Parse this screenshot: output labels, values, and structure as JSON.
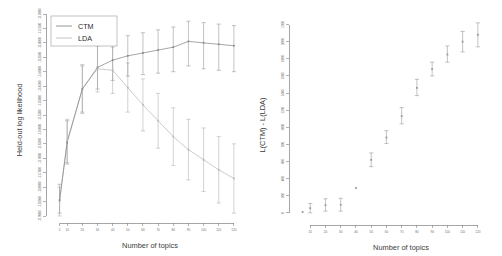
{
  "figure": {
    "background_color": "#ffffff"
  },
  "chart_data": [
    {
      "id": "held-out-likelihood",
      "type": "line",
      "title": "",
      "xlabel": "Number of topics",
      "ylabel": "Held-out log likelihood",
      "grid": false,
      "legend_position": "top-left",
      "xlim": [
        0,
        126
      ],
      "ylim": [
        -119000,
        -112000
      ],
      "xticks": [
        5,
        10,
        20,
        30,
        40,
        50,
        60,
        70,
        80,
        90,
        100,
        110,
        120
      ],
      "xtick_labels": [
        "5",
        "10",
        "20",
        "30",
        "40",
        "50",
        "60",
        "70",
        "80",
        "90",
        "100",
        "110",
        "120"
      ],
      "yticks": [
        -119000,
        -118500,
        -118000,
        -117500,
        -117000,
        -116500,
        -116000,
        -115500,
        -115000,
        -114500,
        -114000,
        -113500,
        -113000,
        -112500,
        -112000
      ],
      "ytick_labels": [
        "-119000",
        "-118500",
        "-118000",
        "-117500",
        "-117000",
        "-116500",
        "-116000",
        "-115500",
        "-115000",
        "-114500",
        "-114000",
        "-113500",
        "-113000",
        "-112500",
        "-112000"
      ],
      "x": [
        5,
        10,
        20,
        30,
        40,
        50,
        60,
        70,
        80,
        90,
        100,
        110,
        120
      ],
      "series": [
        {
          "name": "CTM",
          "color": "#8a8a8a",
          "values": [
            -118450,
            -116450,
            -114600,
            -113850,
            -113600,
            -113450,
            -113350,
            -113250,
            -113150,
            -112950,
            -113000,
            -113050,
            -113100
          ],
          "err_low": [
            -118900,
            -117200,
            -115400,
            -114600,
            -114300,
            -114150,
            -114100,
            -114050,
            -114000,
            -113800,
            -113900,
            -113950,
            -114000
          ],
          "err_high": [
            -117900,
            -115700,
            -113800,
            -113100,
            -112900,
            -112750,
            -112650,
            -112550,
            -112450,
            -112250,
            -112300,
            -112350,
            -112400
          ]
        },
        {
          "name": "LDA",
          "color": "#b9b9b9",
          "values": [
            -118500,
            -116400,
            -114600,
            -113900,
            -113950,
            -114550,
            -115150,
            -115700,
            -116250,
            -116700,
            -117050,
            -117400,
            -117700
          ],
          "err_low": [
            -119000,
            -117150,
            -115450,
            -114700,
            -114750,
            -115400,
            -116050,
            -116650,
            -117250,
            -117750,
            -118150,
            -118550,
            -118900
          ],
          "err_high": [
            -118000,
            -115650,
            -113750,
            -113100,
            -113150,
            -113700,
            -114250,
            -114750,
            -115250,
            -115650,
            -115950,
            -116250,
            -116500
          ]
        }
      ]
    },
    {
      "id": "likelihood-difference",
      "type": "scatter",
      "title": "",
      "xlabel": "Number of topics",
      "ylabel": "L(CTM) - L(LDA)",
      "grid": false,
      "legend_position": "none",
      "xlim": [
        0,
        126
      ],
      "ylim": [
        -60,
        2300
      ],
      "xticks": [
        10,
        20,
        30,
        40,
        50,
        60,
        70,
        80,
        90,
        100,
        110,
        120
      ],
      "xtick_labels": [
        "10",
        "20",
        "30",
        "40",
        "50",
        "60",
        "70",
        "80",
        "90",
        "100",
        "110",
        "120"
      ],
      "yticks": [
        0,
        200,
        400,
        600,
        800,
        1000,
        1200,
        1400,
        1600,
        1800,
        2000,
        2200
      ],
      "ytick_labels": [
        "0",
        "200",
        "400",
        "600",
        "800",
        "1000",
        "1200",
        "1400",
        "1600",
        "1800",
        "2000",
        "2200"
      ],
      "x": [
        5,
        10,
        20,
        30,
        40,
        50,
        60,
        70,
        80,
        90,
        100,
        110,
        120
      ],
      "series": [
        {
          "name": "L(CTM) - L(LDA)",
          "color": "#9a9a9a",
          "values": [
            10,
            55,
            90,
            95,
            290,
            620,
            880,
            1130,
            1460,
            1680,
            1850,
            2000,
            2080
          ],
          "err_low": [
            10,
            0,
            20,
            20,
            290,
            540,
            810,
            1040,
            1370,
            1600,
            1760,
            1880,
            1940
          ],
          "err_high": [
            10,
            110,
            165,
            170,
            290,
            700,
            960,
            1230,
            1560,
            1760,
            1950,
            2120,
            2220
          ]
        }
      ]
    }
  ],
  "legend": {
    "entries": [
      {
        "label": "CTM",
        "color": "#8a8a8a"
      },
      {
        "label": "LDA",
        "color": "#bcbcbc"
      }
    ]
  }
}
